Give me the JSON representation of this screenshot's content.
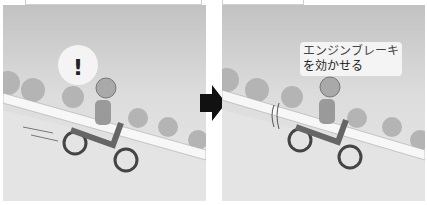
{
  "panels": [
    {
      "id": "before",
      "exclaim": "!",
      "description": "Rider going downhill, startled, speed lines behind motorbike"
    },
    {
      "id": "after",
      "caption_line1": "エンジンブレーキ",
      "caption_line2": "を効かせる",
      "description": "Rider applying engine brake going downhill"
    }
  ],
  "colors": {
    "arrow": "#111111",
    "sky_top": "#c2c2c2",
    "ground": "#e2e2e2"
  }
}
